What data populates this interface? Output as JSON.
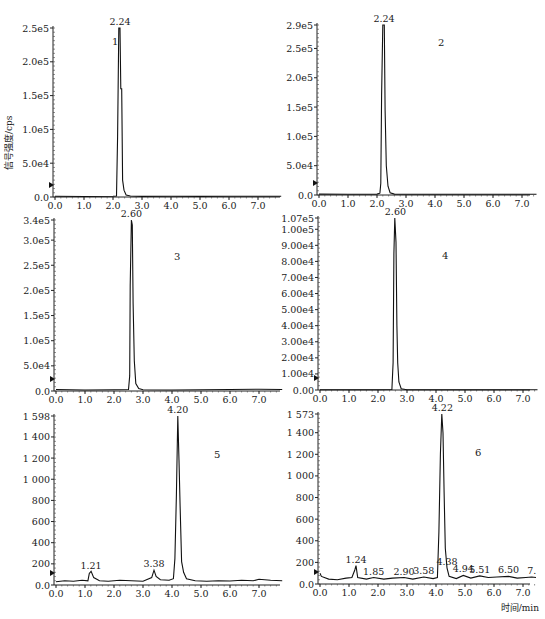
{
  "figure": {
    "ylabel": "信号强度/cps",
    "xlabel": "时间/min"
  },
  "chart_data": [
    {
      "type": "line",
      "panel_id": "1",
      "title": "",
      "xlabel": "",
      "ylabel": "信号强度/cps",
      "xlim": [
        0,
        7.8
      ],
      "ylim": [
        0,
        250000
      ],
      "x_ticks": [
        "0.0",
        "1.0",
        "2.0",
        "3.0",
        "4.0",
        "5.0",
        "6.0",
        "7.0"
      ],
      "y_ticks": [
        "0.0",
        "5.0e4",
        "1.0e5",
        "1.5e5",
        "2.0e5",
        "2.5e5"
      ],
      "y_tick_values": [
        0,
        50000,
        100000,
        150000,
        200000,
        250000
      ],
      "peaks": [
        {
          "rt": 2.24,
          "label": "2.24",
          "height": 250000
        }
      ],
      "trace": [
        [
          0,
          1000
        ],
        [
          1.0,
          800
        ],
        [
          2.0,
          1200
        ],
        [
          2.12,
          1500
        ],
        [
          2.16,
          90000
        ],
        [
          2.2,
          250000
        ],
        [
          2.24,
          250000
        ],
        [
          2.27,
          160000
        ],
        [
          2.3,
          160000
        ],
        [
          2.33,
          25000
        ],
        [
          2.38,
          10000
        ],
        [
          2.45,
          3000
        ],
        [
          2.6,
          1500
        ],
        [
          3.0,
          900
        ],
        [
          4.0,
          1100
        ],
        [
          5.0,
          900
        ],
        [
          6.0,
          1200
        ],
        [
          7.0,
          1100
        ],
        [
          7.8,
          1000
        ]
      ],
      "grid": false
    },
    {
      "type": "line",
      "panel_id": "2",
      "xlim": [
        0,
        7.5
      ],
      "ylim": [
        0,
        290000
      ],
      "x_ticks": [
        "0.0",
        "1.0",
        "2.0",
        "3.0",
        "4.0",
        "5.0",
        "6.0",
        "7.0"
      ],
      "y_ticks": [
        "0.0",
        "5.0e4",
        "1.0e5",
        "1.5e5",
        "2.0e5",
        "2.5e5",
        "2.9e5"
      ],
      "y_tick_values": [
        0,
        50000,
        100000,
        150000,
        200000,
        250000,
        290000
      ],
      "peaks": [
        {
          "rt": 2.24,
          "label": "2.24",
          "height": 290000
        }
      ],
      "trace": [
        [
          0,
          1500
        ],
        [
          1.0,
          1200
        ],
        [
          2.0,
          1500
        ],
        [
          2.1,
          3000
        ],
        [
          2.13,
          20000
        ],
        [
          2.16,
          170000
        ],
        [
          2.2,
          290000
        ],
        [
          2.25,
          290000
        ],
        [
          2.28,
          145000
        ],
        [
          2.32,
          50000
        ],
        [
          2.38,
          15000
        ],
        [
          2.45,
          4000
        ],
        [
          2.6,
          1500
        ],
        [
          4.0,
          1200
        ],
        [
          6.0,
          1400
        ],
        [
          7.5,
          1300
        ]
      ],
      "grid": false
    },
    {
      "type": "line",
      "panel_id": "3",
      "xlim": [
        0,
        7.8
      ],
      "ylim": [
        0,
        340000
      ],
      "x_ticks": [
        "0.0",
        "1.0",
        "2.0",
        "3.0",
        "4.0",
        "5.0",
        "6.0",
        "7.0"
      ],
      "y_ticks": [
        "0.0",
        "5.0e4",
        "1.0e5",
        "1.5e5",
        "2.0e5",
        "2.5e5",
        "3.0e5",
        "3.4e5"
      ],
      "y_tick_values": [
        0,
        50000,
        100000,
        150000,
        200000,
        250000,
        300000,
        340000
      ],
      "peaks": [
        {
          "rt": 2.6,
          "label": "2.60",
          "height": 340000
        }
      ],
      "trace": [
        [
          0,
          3000
        ],
        [
          1.0,
          2000
        ],
        [
          2.0,
          2500
        ],
        [
          2.5,
          3000
        ],
        [
          2.54,
          30000
        ],
        [
          2.56,
          210000
        ],
        [
          2.6,
          340000
        ],
        [
          2.63,
          330000
        ],
        [
          2.66,
          175000
        ],
        [
          2.7,
          60000
        ],
        [
          2.75,
          15000
        ],
        [
          2.85,
          5000
        ],
        [
          3.0,
          2500
        ],
        [
          4.0,
          2000
        ],
        [
          5.0,
          2500
        ],
        [
          6.0,
          3000
        ],
        [
          7.0,
          3500
        ],
        [
          7.8,
          3000
        ]
      ],
      "grid": false
    },
    {
      "type": "line",
      "panel_id": "4",
      "xlim": [
        0,
        7.5
      ],
      "ylim": [
        0,
        107000
      ],
      "x_ticks": [
        "0.0",
        "1.0",
        "2.0",
        "3.0",
        "4.0",
        "5.0",
        "6.0",
        "7.0"
      ],
      "y_ticks": [
        "0.00",
        "1.00e4",
        "2.00e4",
        "3.00e4",
        "4.00e4",
        "5.00e4",
        "6.00e4",
        "7.00e4",
        "8.00e4",
        "9.00e4",
        "1.00e5",
        "1.07e5"
      ],
      "y_tick_values": [
        0,
        10000,
        20000,
        30000,
        40000,
        50000,
        60000,
        70000,
        80000,
        90000,
        100000,
        107000
      ],
      "peaks": [
        {
          "rt": 2.6,
          "label": "2.60",
          "height": 107000
        }
      ],
      "trace": [
        [
          0,
          200
        ],
        [
          2.0,
          200
        ],
        [
          2.48,
          300
        ],
        [
          2.52,
          17000
        ],
        [
          2.55,
          85000
        ],
        [
          2.58,
          107000
        ],
        [
          2.62,
          92000
        ],
        [
          2.65,
          40000
        ],
        [
          2.68,
          17000
        ],
        [
          2.72,
          5000
        ],
        [
          2.8,
          800
        ],
        [
          3.0,
          200
        ],
        [
          7.5,
          200
        ]
      ],
      "grid": false
    },
    {
      "type": "line",
      "panel_id": "5",
      "xlim": [
        0,
        7.8
      ],
      "ylim": [
        0,
        1598
      ],
      "x_ticks": [
        "0.0",
        "1.0",
        "2.0",
        "3.0",
        "4.0",
        "5.0",
        "6.0",
        "7.0"
      ],
      "y_ticks": [
        "0.0",
        "200",
        "400",
        "600",
        "800",
        "1 000",
        "1 200",
        "1 400",
        "1 598"
      ],
      "y_tick_values": [
        0,
        200,
        400,
        600,
        800,
        1000,
        1200,
        1400,
        1598
      ],
      "peaks": [
        {
          "rt": 1.21,
          "label": "1.21",
          "height": 120
        },
        {
          "rt": 3.38,
          "label": "3.38",
          "height": 140
        },
        {
          "rt": 4.2,
          "label": "4.20",
          "height": 1598
        }
      ],
      "trace": [
        [
          0,
          30
        ],
        [
          0.3,
          40
        ],
        [
          0.6,
          35
        ],
        [
          0.9,
          45
        ],
        [
          1.1,
          40
        ],
        [
          1.15,
          110
        ],
        [
          1.21,
          130
        ],
        [
          1.3,
          70
        ],
        [
          1.5,
          40
        ],
        [
          1.8,
          35
        ],
        [
          2.2,
          45
        ],
        [
          2.6,
          40
        ],
        [
          3.0,
          35
        ],
        [
          3.3,
          70
        ],
        [
          3.38,
          140
        ],
        [
          3.45,
          80
        ],
        [
          3.6,
          50
        ],
        [
          3.9,
          45
        ],
        [
          4.05,
          60
        ],
        [
          4.1,
          250
        ],
        [
          4.15,
          850
        ],
        [
          4.2,
          1598
        ],
        [
          4.24,
          1180
        ],
        [
          4.28,
          750
        ],
        [
          4.33,
          220
        ],
        [
          4.4,
          120
        ],
        [
          4.5,
          60
        ],
        [
          4.8,
          40
        ],
        [
          5.2,
          35
        ],
        [
          5.6,
          40
        ],
        [
          6.0,
          38
        ],
        [
          6.4,
          45
        ],
        [
          6.8,
          40
        ],
        [
          7.0,
          55
        ],
        [
          7.4,
          45
        ],
        [
          7.8,
          40
        ]
      ],
      "grid": false
    },
    {
      "type": "line",
      "panel_id": "6",
      "xlim": [
        0,
        7.5
      ],
      "ylim": [
        0,
        1573
      ],
      "x_ticks": [
        "0.0",
        "1.0",
        "2.0",
        "3.0",
        "4.0",
        "5.0",
        "6.0",
        "7.0"
      ],
      "y_ticks": [
        "0.0",
        "200",
        "400",
        "600",
        "800",
        "1 000",
        "1 200",
        "1 400",
        "1 573"
      ],
      "y_tick_values": [
        0,
        200,
        400,
        600,
        800,
        1000,
        1200,
        1400,
        1573
      ],
      "peaks": [
        {
          "rt": 1.24,
          "label": "1.24",
          "height": 170
        },
        {
          "rt": 1.85,
          "label": "1.85",
          "height": 60
        },
        {
          "rt": 2.9,
          "label": "2.90",
          "height": 60
        },
        {
          "rt": 3.58,
          "label": "3.58",
          "height": 65
        },
        {
          "rt": 4.22,
          "label": "4.22",
          "height": 1573
        },
        {
          "rt": 4.38,
          "label": "4.38",
          "height": 150
        },
        {
          "rt": 4.94,
          "label": "4.94",
          "height": 80
        },
        {
          "rt": 5.51,
          "label": "5.51",
          "height": 75
        },
        {
          "rt": 6.5,
          "label": "6.50",
          "height": 70
        },
        {
          "rt": 7.3,
          "label": "7.",
          "height": 65
        }
      ],
      "trace": [
        [
          0,
          100
        ],
        [
          0.05,
          70
        ],
        [
          0.3,
          45
        ],
        [
          0.6,
          40
        ],
        [
          0.9,
          55
        ],
        [
          1.1,
          60
        ],
        [
          1.2,
          130
        ],
        [
          1.24,
          170
        ],
        [
          1.3,
          60
        ],
        [
          1.6,
          45
        ],
        [
          1.85,
          60
        ],
        [
          2.2,
          45
        ],
        [
          2.5,
          55
        ],
        [
          2.9,
          60
        ],
        [
          3.2,
          45
        ],
        [
          3.58,
          65
        ],
        [
          3.9,
          50
        ],
        [
          4.05,
          60
        ],
        [
          4.1,
          480
        ],
        [
          4.15,
          1200
        ],
        [
          4.2,
          1573
        ],
        [
          4.24,
          1400
        ],
        [
          4.28,
          850
        ],
        [
          4.32,
          330
        ],
        [
          4.38,
          150
        ],
        [
          4.45,
          70
        ],
        [
          4.7,
          50
        ],
        [
          4.94,
          80
        ],
        [
          5.2,
          55
        ],
        [
          5.51,
          75
        ],
        [
          5.8,
          60
        ],
        [
          6.1,
          65
        ],
        [
          6.5,
          70
        ],
        [
          6.8,
          55
        ],
        [
          7.1,
          60
        ],
        [
          7.3,
          65
        ],
        [
          7.45,
          60
        ]
      ],
      "grid": false
    }
  ]
}
